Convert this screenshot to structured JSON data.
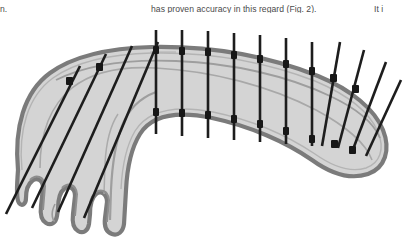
{
  "page": {
    "background_color": "#ffffff",
    "width": 403,
    "height": 240
  },
  "text_fragments": {
    "left_column_tail": "n.",
    "middle_column_line": "has proven accuracy in this regard (Fig. 2).",
    "right_column_tail": "It i",
    "text_color": "#4a4a4a"
  },
  "figure": {
    "caption": "",
    "kind": "anatomical-line-drawing",
    "colors": {
      "wall_fill": "#d4d4d4",
      "wall_outline": "#8a8a8a",
      "wall_outline_dark": "#6d6d6d",
      "lumen_line": "#9a9a9a",
      "hatch_line": "#1d1d1d",
      "background": "#ffffff"
    },
    "hatch_lines": {
      "vertical_count": 9,
      "diagonal_left_count": 4,
      "diagonal_right_count": 4,
      "stroke_width": 2.6
    }
  }
}
